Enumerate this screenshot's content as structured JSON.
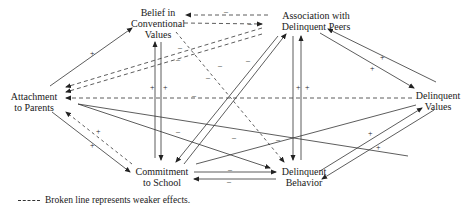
{
  "title": "",
  "nodes": {
    "belief": {
      "line1": "Belief in",
      "line2": "Conventional",
      "line3": "Values"
    },
    "peers": {
      "line1": "Association with",
      "line2": "Delinquent Peers"
    },
    "attachment": {
      "line1": "Attachment",
      "line2": "to Parents"
    },
    "values": {
      "line1": "Delinquent",
      "line2": "Values"
    },
    "commitment": {
      "line1": "Commitment",
      "line2": "to School"
    },
    "behavior": {
      "line1": "Delinquent",
      "line2": "Behavior"
    }
  },
  "legend": {
    "text": "Broken line represents weaker effects."
  },
  "edges": [
    {
      "from": "attachment",
      "to": "belief",
      "sign": "+",
      "style": "solid"
    },
    {
      "from": "peers",
      "to": "belief",
      "sign": "-",
      "style": "dashed"
    },
    {
      "from": "belief",
      "to": "peers",
      "sign": "-",
      "style": "dashed"
    },
    {
      "from": "peers",
      "to": "attachment",
      "sign": "-",
      "style": "dashed"
    },
    {
      "from": "values",
      "to": "attachment",
      "sign": "-",
      "style": "dashed"
    },
    {
      "from": "attachment",
      "to": "behavior",
      "sign": "-",
      "style": "solid"
    },
    {
      "from": "attachment",
      "to": "commitment",
      "sign": "+",
      "style": "solid"
    },
    {
      "from": "commitment",
      "to": "attachment",
      "sign": "+",
      "style": "dashed"
    },
    {
      "from": "commitment",
      "to": "belief",
      "sign": "+",
      "style": "solid"
    },
    {
      "from": "belief",
      "to": "commitment",
      "sign": "+",
      "style": "solid"
    },
    {
      "from": "belief",
      "to": "behavior",
      "sign": "-",
      "style": "dashed"
    },
    {
      "from": "peers",
      "to": "commitment",
      "sign": "-",
      "style": "solid"
    },
    {
      "from": "commitment",
      "to": "peers",
      "sign": "-",
      "style": "solid"
    },
    {
      "from": "peers",
      "to": "behavior",
      "sign": "+",
      "style": "solid"
    },
    {
      "from": "behavior",
      "to": "peers",
      "sign": "+",
      "style": "solid"
    },
    {
      "from": "peers",
      "to": "values",
      "sign": "+",
      "style": "solid"
    },
    {
      "from": "values",
      "to": "peers",
      "sign": "+",
      "style": "solid"
    },
    {
      "from": "commitment",
      "to": "values",
      "sign": "-",
      "style": "solid"
    },
    {
      "from": "commitment",
      "to": "behavior",
      "sign": "-",
      "style": "solid"
    },
    {
      "from": "behavior",
      "to": "commitment",
      "sign": "-",
      "style": "solid"
    },
    {
      "from": "behavior",
      "to": "values",
      "sign": "+",
      "style": "solid"
    },
    {
      "from": "values",
      "to": "behavior",
      "sign": "+",
      "style": "solid"
    }
  ]
}
